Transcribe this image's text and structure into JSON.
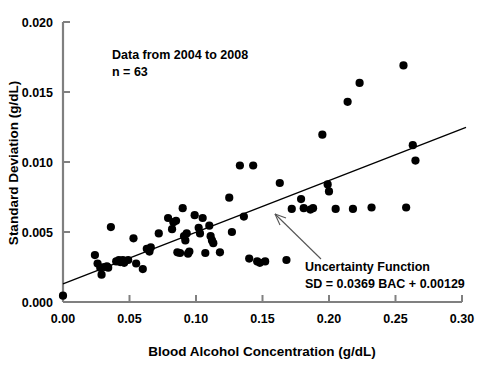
{
  "chart_data": {
    "type": "scatter",
    "title": "",
    "xlabel": "Blood Alcohol Concentration (g/dL)",
    "ylabel": "Standard Deviation (g/dL)",
    "xlim": [
      0.0,
      0.3
    ],
    "ylim": [
      0.0,
      0.02
    ],
    "xticks": [
      "0.00",
      "0.05",
      "0.10",
      "0.15",
      "0.20",
      "0.25",
      "0.30"
    ],
    "xtick_values": [
      0.0,
      0.05,
      0.1,
      0.15,
      0.2,
      0.25,
      0.3
    ],
    "yticks": [
      "0.000",
      "0.005",
      "0.010",
      "0.015",
      "0.020"
    ],
    "ytick_values": [
      0.0,
      0.005,
      0.01,
      0.015,
      0.02
    ],
    "grid": false,
    "legend": "none",
    "marker": "filled-circle",
    "marker_color": "#000000",
    "series": [
      {
        "name": "Standard Deviation vs BAC",
        "points": [
          [
            0.0,
            0.00045
          ],
          [
            0.024,
            0.00335
          ],
          [
            0.026,
            0.00275
          ],
          [
            0.028,
            0.00245
          ],
          [
            0.029,
            0.00195
          ],
          [
            0.031,
            0.0025
          ],
          [
            0.033,
            0.00255
          ],
          [
            0.034,
            0.00245
          ],
          [
            0.036,
            0.00535
          ],
          [
            0.04,
            0.0029
          ],
          [
            0.042,
            0.003
          ],
          [
            0.043,
            0.00285
          ],
          [
            0.045,
            0.003
          ],
          [
            0.046,
            0.0028
          ],
          [
            0.049,
            0.003
          ],
          [
            0.053,
            0.00455
          ],
          [
            0.055,
            0.00275
          ],
          [
            0.06,
            0.00235
          ],
          [
            0.063,
            0.0038
          ],
          [
            0.065,
            0.0036
          ],
          [
            0.066,
            0.0039
          ],
          [
            0.072,
            0.0049
          ],
          [
            0.079,
            0.006
          ],
          [
            0.082,
            0.0052
          ],
          [
            0.083,
            0.0057
          ],
          [
            0.085,
            0.0058
          ],
          [
            0.086,
            0.00355
          ],
          [
            0.088,
            0.0035
          ],
          [
            0.09,
            0.0067
          ],
          [
            0.091,
            0.0047
          ],
          [
            0.092,
            0.0044
          ],
          [
            0.093,
            0.0049
          ],
          [
            0.094,
            0.00345
          ],
          [
            0.095,
            0.0036
          ],
          [
            0.099,
            0.0062
          ],
          [
            0.102,
            0.0053
          ],
          [
            0.103,
            0.0049
          ],
          [
            0.105,
            0.006
          ],
          [
            0.107,
            0.0035
          ],
          [
            0.11,
            0.00545
          ],
          [
            0.111,
            0.0047
          ],
          [
            0.112,
            0.0044
          ],
          [
            0.113,
            0.0042
          ],
          [
            0.118,
            0.00355
          ],
          [
            0.125,
            0.00745
          ],
          [
            0.127,
            0.005
          ],
          [
            0.133,
            0.00975
          ],
          [
            0.136,
            0.0061
          ],
          [
            0.14,
            0.0031
          ],
          [
            0.143,
            0.00975
          ],
          [
            0.146,
            0.0029
          ],
          [
            0.148,
            0.0028
          ],
          [
            0.152,
            0.0029
          ],
          [
            0.163,
            0.0085
          ],
          [
            0.168,
            0.003
          ],
          [
            0.172,
            0.00665
          ],
          [
            0.179,
            0.00735
          ],
          [
            0.181,
            0.0067
          ],
          [
            0.186,
            0.0066
          ],
          [
            0.188,
            0.0067
          ],
          [
            0.195,
            0.01195
          ],
          [
            0.199,
            0.0084
          ],
          [
            0.2,
            0.0079
          ],
          [
            0.205,
            0.00665
          ],
          [
            0.214,
            0.0143
          ],
          [
            0.218,
            0.00665
          ],
          [
            0.223,
            0.01565
          ],
          [
            0.232,
            0.00675
          ],
          [
            0.256,
            0.0169
          ],
          [
            0.258,
            0.00675
          ],
          [
            0.263,
            0.0112
          ],
          [
            0.265,
            0.0101
          ]
        ]
      }
    ],
    "fit_line": {
      "label": "Uncertainty Function",
      "equation": "SD = 0.0369 BAC + 0.00129",
      "slope": 0.0369,
      "intercept": 0.00129,
      "x_start": 0.0,
      "x_end": 0.303,
      "color": "#000000"
    },
    "annotations": [
      {
        "id": "data-years",
        "text": "Data from 2004 to 2008"
      },
      {
        "id": "sample-size",
        "text": "n = 63"
      }
    ]
  },
  "axes": {
    "x_label": "Blood Alcohol Concentration (g/dL)",
    "y_label": "Standard Deviation (g/dL)",
    "axis_color": "#808080"
  }
}
